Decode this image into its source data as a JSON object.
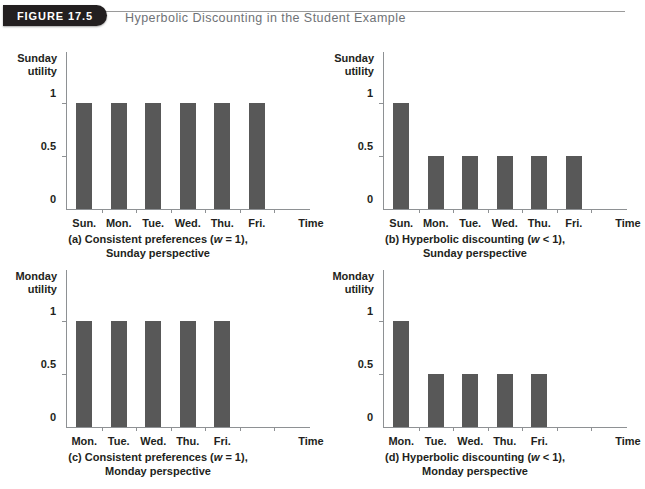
{
  "header": {
    "figure_tab_label": "FIGURE 17.5",
    "title": "Hyperbolic Discounting in the Student Example",
    "tab_color": "#231f20",
    "title_color": "#6f7276",
    "rule_color": "#9a9a9a"
  },
  "style": {
    "bar_color": "#585858",
    "axis_color": "#8e9194",
    "text_color": "#231f20"
  },
  "chart_data": [
    {
      "id": "a",
      "type": "bar",
      "title": "",
      "caption_line1": "(a) Consistent preferences (w = 1),",
      "caption_line2": "Sunday perspective",
      "caption_prefix": "(a) Consistent preferences (",
      "caption_italic": "w",
      "caption_suffix": " = 1),",
      "ylabel_line1": "Sunday",
      "ylabel_line2": "utility",
      "xlabel": "Time",
      "categories": [
        "Sun.",
        "Mon.",
        "Tue.",
        "Wed.",
        "Thu.",
        "Fri."
      ],
      "values": [
        1,
        1,
        1,
        1,
        1,
        1
      ],
      "ytick_labels": [
        "1",
        "0.5",
        "0"
      ],
      "ytick_values": [
        1,
        0.5,
        0
      ],
      "ylim": [
        0,
        1
      ],
      "grid": false,
      "legend": "none",
      "slots": 7
    },
    {
      "id": "b",
      "type": "bar",
      "title": "",
      "caption_line1": "(b) Hyperbolic discounting (w < 1),",
      "caption_line2": "Sunday perspective",
      "caption_prefix": "(b) Hyperbolic discounting (",
      "caption_italic": "w",
      "caption_suffix": " < 1),",
      "ylabel_line1": "Sunday",
      "ylabel_line2": "utility",
      "xlabel": "Time",
      "categories": [
        "Sun.",
        "Mon.",
        "Tue.",
        "Wed.",
        "Thu.",
        "Fri."
      ],
      "values": [
        1,
        0.5,
        0.5,
        0.5,
        0.5,
        0.5
      ],
      "ytick_labels": [
        "1",
        "0.5",
        "0"
      ],
      "ytick_values": [
        1,
        0.5,
        0
      ],
      "ylim": [
        0,
        1
      ],
      "grid": false,
      "legend": "none",
      "slots": 7
    },
    {
      "id": "c",
      "type": "bar",
      "title": "",
      "caption_line1": "(c) Consistent preferences (w = 1),",
      "caption_line2": "Monday perspective",
      "caption_prefix": "(c) Consistent preferences (",
      "caption_italic": "w",
      "caption_suffix": " = 1),",
      "ylabel_line1": "Monday",
      "ylabel_line2": "utility",
      "xlabel": "Time",
      "categories": [
        "Mon.",
        "Tue.",
        "Wed.",
        "Thu.",
        "Fri."
      ],
      "values": [
        1,
        1,
        1,
        1,
        1
      ],
      "ytick_labels": [
        "1",
        "0.5",
        "0"
      ],
      "ytick_values": [
        1,
        0.5,
        0
      ],
      "ylim": [
        0,
        1
      ],
      "grid": false,
      "legend": "none",
      "slots": 7
    },
    {
      "id": "d",
      "type": "bar",
      "title": "",
      "caption_line1": "(d) Hyperbolic discounting (w < 1),",
      "caption_line2": "Monday perspective",
      "caption_prefix": "(d) Hyperbolic discounting (",
      "caption_italic": "w",
      "caption_suffix": " < 1),",
      "ylabel_line1": "Monday",
      "ylabel_line2": "utility",
      "xlabel": "Time",
      "categories": [
        "Mon.",
        "Tue.",
        "Wed.",
        "Thu.",
        "Fri."
      ],
      "values": [
        1,
        0.5,
        0.5,
        0.5,
        0.5
      ],
      "ytick_labels": [
        "1",
        "0.5",
        "0"
      ],
      "ytick_values": [
        1,
        0.5,
        0
      ],
      "ylim": [
        0,
        1
      ],
      "grid": false,
      "legend": "none",
      "slots": 7
    }
  ]
}
